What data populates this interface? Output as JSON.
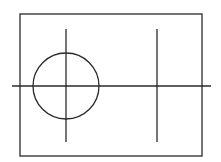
{
  "canvas": {
    "width": 221,
    "height": 162,
    "background": "#ffffff"
  },
  "stroke": {
    "color": "#2a2a2a",
    "width": 1.3
  },
  "frame": {
    "x": 20,
    "y": 14,
    "width": 182,
    "height": 142
  },
  "horizontal_axis": {
    "x1": 12,
    "y1": 86,
    "x2": 211,
    "y2": 86
  },
  "left_vertical": {
    "x1": 66,
    "y1": 29,
    "x2": 66,
    "y2": 142
  },
  "right_vertical": {
    "x1": 157,
    "y1": 29,
    "x2": 157,
    "y2": 142
  },
  "circle": {
    "cx": 66,
    "cy": 86,
    "r": 33
  }
}
